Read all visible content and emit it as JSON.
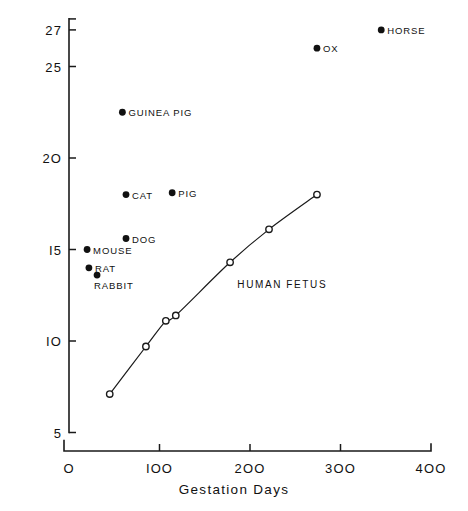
{
  "chart_data": {
    "type": "scatter",
    "title": "",
    "xlabel": "Gestation  Days",
    "ylabel": "Solids  g / 100 g",
    "xlim": [
      0,
      400
    ],
    "ylim": [
      4.3,
      27.6
    ],
    "grid": false,
    "legend_position": "inline-labels",
    "xticks": [
      {
        "value": 0,
        "label": "O"
      },
      {
        "value": 100,
        "label": "IOO"
      },
      {
        "value": 200,
        "label": "2OO"
      },
      {
        "value": 300,
        "label": "3OO"
      },
      {
        "value": 400,
        "label": "4OO"
      }
    ],
    "yticks": [
      {
        "value": 5,
        "label": "5"
      },
      {
        "value": 10,
        "label": "IO"
      },
      {
        "value": 15,
        "label": "I5"
      },
      {
        "value": 20,
        "label": "2O"
      },
      {
        "value": 25,
        "label": "25"
      },
      {
        "value": 27,
        "label": "27"
      }
    ],
    "series": [
      {
        "name": "Animal species",
        "marker": "filled-circle",
        "points": [
          {
            "label": "MOUSE",
            "x": 20,
            "y": 15.0,
            "label_side": "right"
          },
          {
            "label": "RAT",
            "x": 22,
            "y": 14.0,
            "label_side": "right"
          },
          {
            "label": "RABBIT",
            "x": 31,
            "y": 13.6,
            "label_side": "below"
          },
          {
            "label": "DOG",
            "x": 63,
            "y": 15.6,
            "label_side": "right"
          },
          {
            "label": "CAT",
            "x": 63,
            "y": 18.0,
            "label_side": "right"
          },
          {
            "label": "GUINEA  PIG",
            "x": 59,
            "y": 22.5,
            "label_side": "right"
          },
          {
            "label": "PIG",
            "x": 114,
            "y": 18.1,
            "label_side": "right"
          },
          {
            "label": "OX",
            "x": 274,
            "y": 26.0,
            "label_side": "right"
          },
          {
            "label": "HORSE",
            "x": 345,
            "y": 27.0,
            "label_side": "right"
          }
        ]
      },
      {
        "name": "HUMAN  FETUS",
        "marker": "open-circle",
        "curve": true,
        "label_x": 186,
        "label_y": 13.1,
        "points": [
          {
            "x": 45,
            "y": 7.1
          },
          {
            "x": 85,
            "y": 9.7
          },
          {
            "x": 107,
            "y": 11.1
          },
          {
            "x": 118,
            "y": 11.4
          },
          {
            "x": 178,
            "y": 14.3
          },
          {
            "x": 221,
            "y": 16.1
          },
          {
            "x": 274,
            "y": 18.0
          }
        ]
      }
    ]
  }
}
